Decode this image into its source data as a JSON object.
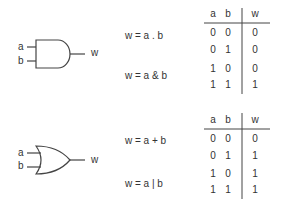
{
  "and_section": {
    "gate_type": "AND",
    "inputs": [
      "a",
      "b"
    ],
    "output": "w",
    "equations": [
      "w = a . b",
      "w = a & b"
    ],
    "truth_table": {
      "headers": [
        "a",
        "b",
        "w"
      ],
      "rows": [
        [
          "0",
          "0",
          "0"
        ],
        [
          "0",
          "1",
          "0"
        ],
        [
          "1",
          "0",
          "0"
        ],
        [
          "1",
          "1",
          "1"
        ]
      ]
    }
  },
  "or_section": {
    "gate_type": "OR",
    "inputs": [
      "a",
      "b"
    ],
    "output": "w",
    "equations": [
      "w = a + b",
      "w = a | b"
    ],
    "truth_table": {
      "headers": [
        "a",
        "b",
        "w"
      ],
      "rows": [
        [
          "0",
          "0",
          "0"
        ],
        [
          "0",
          "1",
          "1"
        ],
        [
          "1",
          "0",
          "1"
        ],
        [
          "1",
          "1",
          "1"
        ]
      ]
    }
  },
  "colors": {
    "stroke": "#444444",
    "text": "#333333"
  }
}
